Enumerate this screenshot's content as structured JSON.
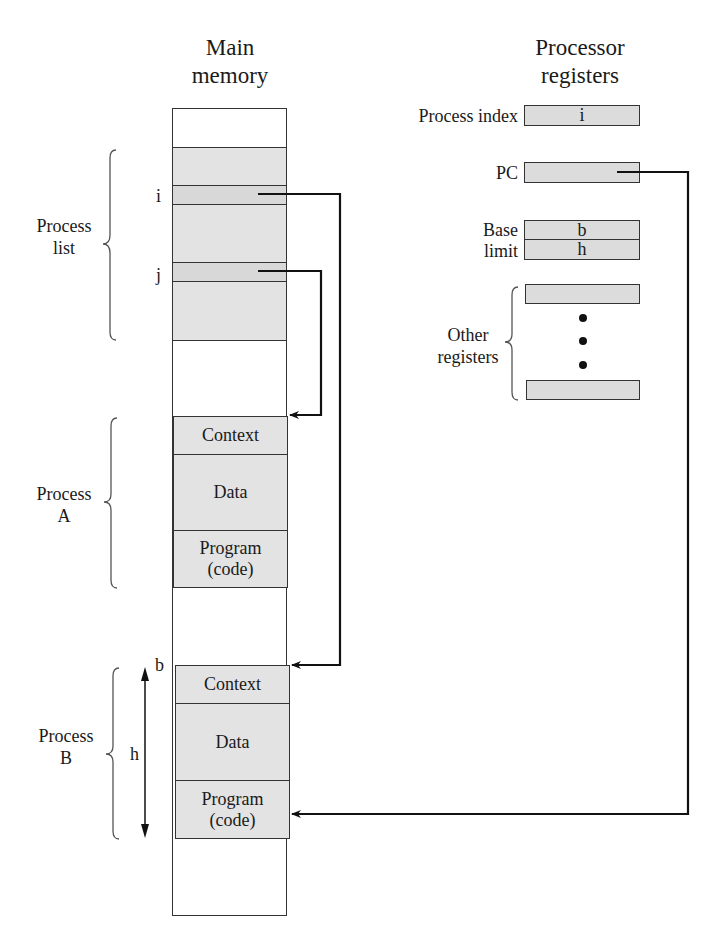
{
  "memory": {
    "title_line1": "Main",
    "title_line2": "memory",
    "process_list_label_1": "Process",
    "process_list_label_2": "list",
    "entry_i": "i",
    "entry_j": "j",
    "process_a": {
      "label_1": "Process",
      "label_2": "A",
      "context": "Context",
      "data": "Data",
      "program_1": "Program",
      "program_2": "(code)"
    },
    "process_b": {
      "label_1": "Process",
      "label_2": "B",
      "context": "Context",
      "data": "Data",
      "program_1": "Program",
      "program_2": "(code)",
      "base_marker": "b",
      "length_marker": "h"
    }
  },
  "registers": {
    "title_line1": "Processor",
    "title_line2": "registers",
    "process_index_label": "Process index",
    "process_index_value": "i",
    "pc_label": "PC",
    "base_label": "Base",
    "base_value": "b",
    "limit_label": "limit",
    "limit_value": "h",
    "other_label_1": "Other",
    "other_label_2": "registers"
  }
}
